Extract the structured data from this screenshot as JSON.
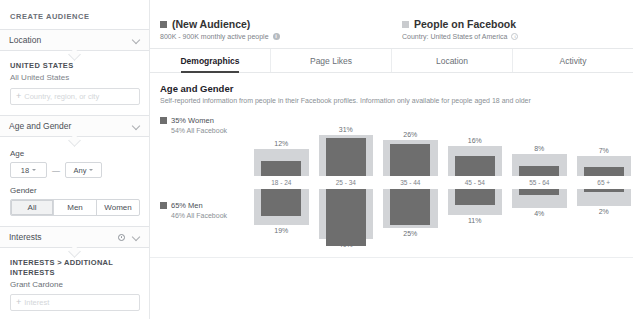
{
  "sidebar": {
    "title": "CREATE AUDIENCE",
    "location": {
      "header": "Location",
      "chevron_icon": "chevron-down-icon",
      "country_title": "UNITED STATES",
      "country_sub": "All United States",
      "input_placeholder": "Country, region, or city",
      "plus_icon": "plus-icon"
    },
    "age_gender": {
      "header": "Age and Gender",
      "chevron_icon": "chevron-down-icon",
      "age_label": "Age",
      "age_min": "18",
      "age_dash": "—",
      "age_max": "Any",
      "gender_label": "Gender",
      "gender_options": [
        "All",
        "Men",
        "Women"
      ],
      "gender_selected": "All"
    },
    "interests": {
      "header": "Interests",
      "gear_icon": "gear-icon",
      "chevron_icon": "chevron-down-icon",
      "breadcrumb": "INTERESTS > ADDITIONAL INTERESTS",
      "tag": "Grant Cardone",
      "input_placeholder": "Interest",
      "plus_icon": "plus-icon"
    }
  },
  "header": {
    "audience": {
      "name": "(New Audience)",
      "subtitle": "800K - 900K monthly active people",
      "swatch_color": "#6e6e6e",
      "info_icon": "info-icon"
    },
    "benchmark": {
      "name": "People on Facebook",
      "subtitle": "Country: United States of America",
      "swatch_color": "#c9cbce",
      "info_icon": "info-icon"
    }
  },
  "tabs": [
    {
      "label": "Demographics",
      "active": true
    },
    {
      "label": "Page Likes",
      "active": false
    },
    {
      "label": "Location",
      "active": false
    },
    {
      "label": "Activity",
      "active": false
    }
  ],
  "section": {
    "title": "Age and Gender",
    "description": "Self-reported information from people in their Facebook profiles. Information only available for people aged 18 and older"
  },
  "legend": {
    "women": {
      "main": "35% Women",
      "sub": "54% All Facebook"
    },
    "men": {
      "main": "65% Men",
      "sub": "46% All Facebook"
    }
  },
  "chart_data": {
    "type": "bar",
    "title": "Age and Gender",
    "categories": [
      "18 - 24",
      "25 - 34",
      "35 - 44",
      "45 - 54",
      "55 - 64",
      "65 +"
    ],
    "xlabel": "Age range",
    "ylabel": "Percent of audience",
    "grid": false,
    "legend_position": "left",
    "orientation": "diverging-vertical",
    "series": [
      {
        "name": "35% Women",
        "group": "women",
        "color": "#6e6e6e",
        "values": [
          12,
          31,
          26,
          16,
          8,
          7
        ],
        "labels": [
          "12%",
          "31%",
          "26%",
          "16%",
          "8%",
          "7%"
        ]
      },
      {
        "name": "65% Men",
        "group": "men",
        "color": "#6e6e6e",
        "values": [
          19,
          40,
          25,
          11,
          4,
          2
        ],
        "labels": [
          "19%",
          "40%",
          "25%",
          "11%",
          "4%",
          "2%"
        ]
      },
      {
        "name": "People on Facebook (women benchmark)",
        "group": "women",
        "color": "#d2d4d7",
        "values": [
          15,
          27,
          23,
          18,
          11,
          10
        ],
        "benchmark": true
      },
      {
        "name": "People on Facebook (men benchmark)",
        "group": "men",
        "color": "#d2d4d7",
        "values": [
          21,
          31,
          23,
          14,
          9,
          8
        ],
        "benchmark": true
      }
    ],
    "ylim": [
      0,
      42
    ]
  }
}
